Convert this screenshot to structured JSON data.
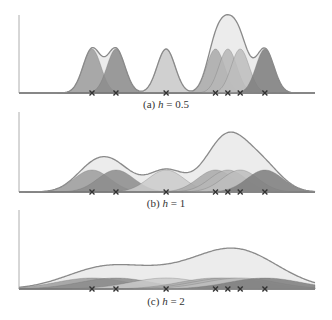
{
  "chart_data": [
    {
      "type": "area",
      "title": "(a) h = 0.5",
      "caption_prefix": "(a) ",
      "caption_var": "h",
      "caption_value": " = 0.5",
      "bandwidth": 0.5,
      "data_points": [
        0,
        0.97,
        3,
        5,
        5.5,
        6,
        7
      ],
      "xlabel": "",
      "ylabel": "",
      "xlim": [
        -2.95,
        9.03
      ],
      "grid": false,
      "legend": "none"
    },
    {
      "type": "area",
      "title": "(b) h = 1",
      "caption_prefix": "(b) ",
      "caption_var": "h",
      "caption_value": " = 1",
      "bandwidth": 1,
      "data_points": [
        0,
        0.97,
        3,
        5,
        5.5,
        6,
        7
      ],
      "xlabel": "",
      "ylabel": "",
      "xlim": [
        -2.95,
        9.03
      ],
      "grid": false,
      "legend": "none"
    },
    {
      "type": "area",
      "title": "(c) h = 2",
      "caption_prefix": "(c) ",
      "caption_var": "h",
      "caption_value": " = 2",
      "bandwidth": 2,
      "data_points": [
        0,
        0.97,
        3,
        5,
        5.5,
        6,
        7
      ],
      "xlabel": "",
      "ylabel": "",
      "xlim": [
        -2.95,
        9.03
      ],
      "grid": false,
      "legend": "none"
    }
  ],
  "style": {
    "kernel_colors": [
      "#9c9c9c",
      "#8c8c8c",
      "#cbcbcb",
      "#a9a9a9",
      "#b6b6b6",
      "#bdbdbd",
      "#7d7d7d"
    ],
    "sum_fill": "#ececec",
    "sum_stroke": "#8a8a8a",
    "axis_color": "#9a9a9a",
    "marker_color": "#333333"
  },
  "layout": {
    "panels": [
      {
        "axis_top": 15,
        "baseline": 93,
        "caption_y": 98
      },
      {
        "axis_top": 112,
        "baseline": 192,
        "caption_y": 197
      },
      {
        "axis_top": 210,
        "baseline": 289,
        "caption_y": 295
      }
    ],
    "x_left": 19,
    "x_right": 315,
    "origin_px": 92,
    "unit_px": 24.7,
    "sigma_px_per_h": 18,
    "kernel_peak_px_times_h": 22
  }
}
